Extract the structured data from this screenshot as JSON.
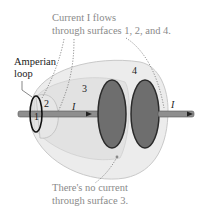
{
  "figure": {
    "annotation_top": {
      "line1": "Current I flows",
      "line2": "through surfaces 1, 2, and 4."
    },
    "annotation_bottom": {
      "line1": "There's no current",
      "line2": "through surface 3."
    },
    "loop_label": {
      "line1": "Amperian",
      "line2": "loop"
    },
    "surface_labels": [
      "1",
      "2",
      "3",
      "4"
    ],
    "current_label": "I",
    "colors": {
      "surface_fill": "#e6e6e6",
      "surface_edge": "#c8c8c8",
      "plate_fill": "#6e6e6e",
      "plate_edge": "#2a2a2a",
      "wire": "#8c8c8c",
      "annotation_text": "#8a8a8a",
      "dotted_leader": "#777777"
    }
  }
}
